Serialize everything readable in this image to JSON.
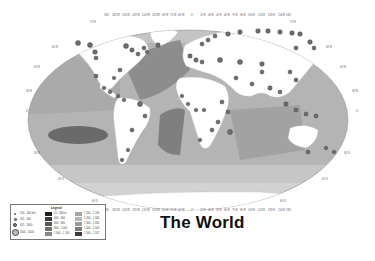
{
  "title": "The World",
  "map": {
    "projection": "Robinson",
    "top_axis_ticks": [
      "180°",
      "165°W",
      "150°W",
      "135°W",
      "120°W",
      "105°W",
      "90°W",
      "75°W",
      "60°W",
      "45°W",
      "30°W",
      "15°W",
      "0°",
      "15°E",
      "30°E",
      "45°E",
      "60°E",
      "75°E",
      "90°E",
      "105°E",
      "120°E",
      "135°E",
      "150°E",
      "165°E",
      "180°"
    ],
    "left_axis_ticks": [
      "75°N",
      "60°N",
      "45°N",
      "30°N",
      "15°N",
      "0°",
      "15°S",
      "30°S",
      "45°S",
      "60°S",
      "75°S"
    ],
    "colors": {
      "land": "#ffffff",
      "shallow_ocean": "#c9c9c9",
      "mid_ocean": "#a8a8a8",
      "deep_ocean": "#8a8a8a",
      "deepest_ocean": "#6a6a6a",
      "site_dot": "#6f6f6f",
      "site_dot_border": "#2a2a2a"
    }
  },
  "legend": {
    "title": "Legend",
    "symbols": [
      {
        "label": "100 - 300 m/s"
      },
      {
        "label": "301 - 600"
      },
      {
        "label": "601 - 3000"
      },
      {
        "label": "3001 - 5000"
      }
    ],
    "depth_classes_col1": [
      {
        "label": "25 - 400 m",
        "color": "#1e1e1e"
      },
      {
        "label": "400 - 600",
        "color": "#3a3a3a"
      },
      {
        "label": "600 - 800",
        "color": "#575757"
      },
      {
        "label": "800 - 1 000",
        "color": "#6f6f6f"
      },
      {
        "label": "1 000 - 1 100",
        "color": "#888888"
      }
    ],
    "depth_classes_col2": [
      {
        "label": "1 100 - 1 200",
        "color": "#a5a5a5"
      },
      {
        "label": "1 200 - 1 300",
        "color": "#b5b5b5"
      },
      {
        "label": "1 300 - 1 400",
        "color": "#9a9a9a"
      },
      {
        "label": "1 400 - 1 500",
        "color": "#7a7a7a"
      },
      {
        "label": "1 500 - 1 557",
        "color": "#3c3c3c"
      }
    ]
  }
}
